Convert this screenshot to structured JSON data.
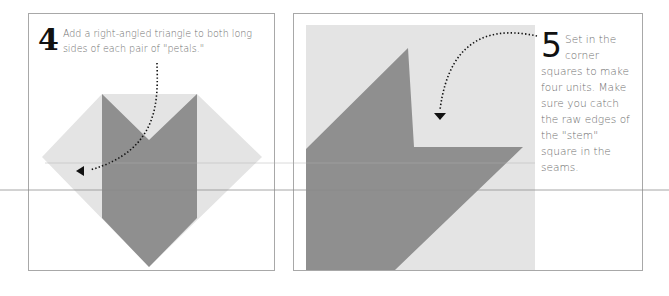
{
  "steps": [
    {
      "number": "4",
      "text": "Add a right-angled triangle to both long sides of each pair of \"petals.\""
    },
    {
      "number": "5",
      "text": "Set in the corner squares to make four units. Make sure you catch the raw edges of the \"stem\" square in the seams."
    }
  ],
  "colors": {
    "dark_fabric": "#8f8f8f",
    "light_fabric": "#e4e4e4",
    "panel_border": "#a8a8a8",
    "arrow": "#111111",
    "rule_line": "#8a8a8a"
  },
  "icons": {
    "arrow_step_4": "dotted-curved-arrow-icon",
    "arrow_step_5": "dotted-curved-arrow-icon"
  }
}
